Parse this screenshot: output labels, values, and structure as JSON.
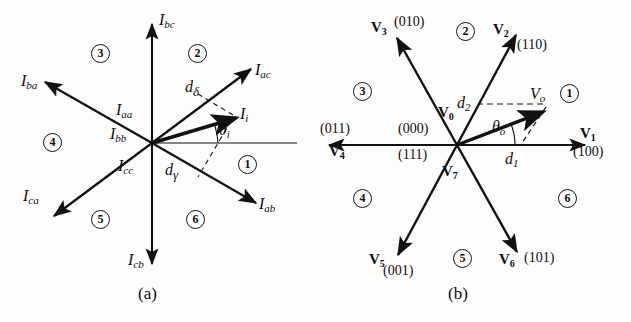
{
  "figure": {
    "type": "two-panel-vector-space-diagram",
    "panels": [
      {
        "id": "a",
        "caption": "(a)",
        "description": "Current space vector hexagon for a matrix/current-source converter",
        "center": {
          "x": 152,
          "y": 143
        },
        "axis_color": "#111111",
        "vectors": [
          {
            "name": "I_bc",
            "label": "I",
            "sub": "bc",
            "angle_deg": 90,
            "length": 120,
            "style": "solid"
          },
          {
            "name": "I_ac",
            "label": "I",
            "sub": "ac",
            "angle_deg": 37,
            "length": 122,
            "style": "solid"
          },
          {
            "name": "I_ab",
            "label": "I",
            "sub": "ab",
            "angle_deg": -33,
            "length": 122,
            "style": "solid"
          },
          {
            "name": "I_cb",
            "label": "I",
            "sub": "cb",
            "angle_deg": -90,
            "length": 120,
            "style": "solid"
          },
          {
            "name": "I_ca",
            "label": "I",
            "sub": "ca",
            "angle_deg": 213,
            "length": 122,
            "style": "solid"
          },
          {
            "name": "I_ba",
            "label": "I",
            "sub": "ba",
            "angle_deg": 151,
            "length": 122,
            "style": "solid"
          },
          {
            "name": "I_i",
            "label": "I",
            "sub": "i",
            "angle_deg": 15,
            "length": 88,
            "style": "solid-thick"
          }
        ],
        "zero_vectors": [
          {
            "label": "I",
            "sub": "aa"
          },
          {
            "label": "I",
            "sub": "bb"
          },
          {
            "label": "I",
            "sub": "cc"
          }
        ],
        "duty_labels": [
          {
            "label": "d",
            "sub": "δ",
            "name": "d-delta"
          },
          {
            "label": "d",
            "sub": "γ",
            "name": "d-gamma"
          }
        ],
        "angle_label": {
          "label": "θ",
          "sub": "i",
          "name": "theta-i"
        },
        "sectors": [
          "1",
          "2",
          "3",
          "4",
          "5",
          "6"
        ]
      },
      {
        "id": "b",
        "caption": "(b)",
        "description": "Voltage space vector hexagon for a voltage-source inverter",
        "center": {
          "x": 142,
          "y": 145
        },
        "axis_color": "#111111",
        "vectors": [
          {
            "name": "V1",
            "label": "V",
            "sub": "1",
            "state": "(100)",
            "angle_deg": 0,
            "length": 128,
            "style": "solid"
          },
          {
            "name": "V2",
            "label": "V",
            "sub": "2",
            "state": "(110)",
            "angle_deg": 62,
            "length": 125,
            "style": "solid"
          },
          {
            "name": "V3",
            "label": "V",
            "sub": "3",
            "state": "(010)",
            "angle_deg": 119,
            "length": 125,
            "style": "solid"
          },
          {
            "name": "V4",
            "label": "V",
            "sub": "4",
            "state": "(011)",
            "angle_deg": 180,
            "length": 128,
            "style": "solid"
          },
          {
            "name": "V5",
            "label": "V",
            "sub": "5",
            "state": "(001)",
            "angle_deg": 241,
            "length": 125,
            "style": "solid"
          },
          {
            "name": "V6",
            "label": "V",
            "sub": "6",
            "state": "(101)",
            "angle_deg": 299,
            "length": 125,
            "style": "solid"
          },
          {
            "name": "Vo",
            "label": "V",
            "sub": "o",
            "angle_deg": 21,
            "length": 92,
            "style": "solid-thick"
          }
        ],
        "zero_vectors": [
          {
            "label": "V",
            "sub": "0",
            "state": "(000)"
          },
          {
            "label": "V",
            "sub": "7",
            "state": "(111)"
          }
        ],
        "duty_labels": [
          {
            "label": "d",
            "sub": "2",
            "name": "d-two"
          },
          {
            "label": "d",
            "sub": "1",
            "name": "d-one"
          }
        ],
        "angle_label": {
          "label": "θ",
          "sub": "o",
          "name": "theta-o"
        },
        "sectors": [
          "1",
          "2",
          "3",
          "4",
          "5",
          "6"
        ]
      }
    ]
  },
  "panel_a": {
    "caption": "(a)",
    "lbl_Ibc": {
      "base": "I",
      "sub": "bc"
    },
    "lbl_Iac": {
      "base": "I",
      "sub": "ac"
    },
    "lbl_Iab": {
      "base": "I",
      "sub": "ab"
    },
    "lbl_Icb": {
      "base": "I",
      "sub": "cb"
    },
    "lbl_Ica": {
      "base": "I",
      "sub": "ca"
    },
    "lbl_Iba": {
      "base": "I",
      "sub": "ba"
    },
    "lbl_Ii": {
      "base": "I",
      "sub": "i"
    },
    "lbl_Iaa": {
      "base": "I",
      "sub": "aa"
    },
    "lbl_Ibb": {
      "base": "I",
      "sub": "bb"
    },
    "lbl_Icc": {
      "base": "I",
      "sub": "cc"
    },
    "lbl_ddelta": {
      "base": "d",
      "sub": "δ"
    },
    "lbl_dgamma": {
      "base": "d",
      "sub": "γ"
    },
    "lbl_thetai": {
      "base": "θ",
      "sub": "i"
    },
    "sector1": "1",
    "sector2": "2",
    "sector3": "3",
    "sector4": "4",
    "sector5": "5",
    "sector6": "6"
  },
  "panel_b": {
    "caption": "(b)",
    "lbl_V1": {
      "base": "V",
      "sub": "1"
    },
    "lbl_V2": {
      "base": "V",
      "sub": "2"
    },
    "lbl_V3": {
      "base": "V",
      "sub": "3"
    },
    "lbl_V4": {
      "base": "V",
      "sub": "4"
    },
    "lbl_V5": {
      "base": "V",
      "sub": "5"
    },
    "lbl_V6": {
      "base": "V",
      "sub": "6"
    },
    "lbl_V0": {
      "base": "V",
      "sub": "0"
    },
    "lbl_V7": {
      "base": "V",
      "sub": "7"
    },
    "lbl_Vo": {
      "base": "V",
      "sub": "o"
    },
    "state_100": "(100)",
    "state_110": "(110)",
    "state_010": "(010)",
    "state_011": "(011)",
    "state_001": "(001)",
    "state_101": "(101)",
    "state_000": "(000)",
    "state_111": "(111)",
    "lbl_d1": {
      "base": "d",
      "sub": "1"
    },
    "lbl_d2": {
      "base": "d",
      "sub": "2"
    },
    "lbl_thetao": {
      "base": "θ",
      "sub": "o"
    },
    "sector1": "1",
    "sector2": "2",
    "sector3": "3",
    "sector4": "4",
    "sector5": "5",
    "sector6": "6"
  }
}
